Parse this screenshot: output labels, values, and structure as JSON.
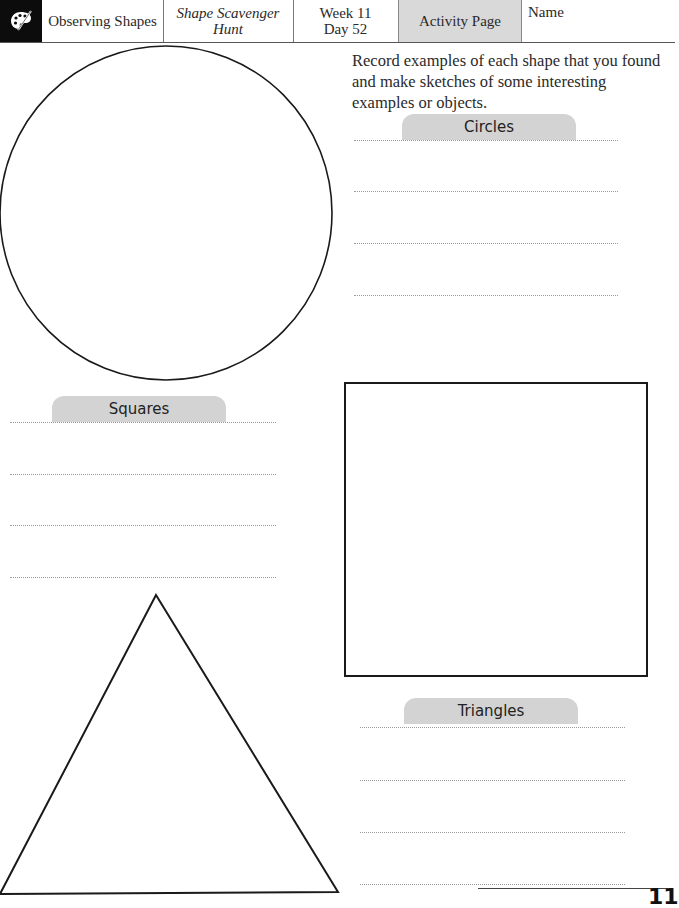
{
  "header": {
    "icon": "palette-icon",
    "subject": "Observing Shapes",
    "lesson_line1": "Shape Scavenger",
    "lesson_line2": "Hunt",
    "week": "Week 11",
    "day": "Day 52",
    "page_type": "Activity Page",
    "name_label": "Name"
  },
  "instructions": "Record examples of each shape that you found and make sketches of some interesting examples or objects.",
  "sections": {
    "circles": {
      "label": "Circles",
      "lines": 4
    },
    "squares": {
      "label": "Squares",
      "lines": 4
    },
    "triangles": {
      "label": "Triangles",
      "lines": 4
    }
  },
  "shapes": [
    "circle",
    "square",
    "triangle"
  ],
  "footer": {
    "page_number": "11"
  },
  "colors": {
    "tab_fill": "#d3d3d3",
    "header_active_fill": "#d9d9d9",
    "icon_bg": "#0c0c0c"
  }
}
